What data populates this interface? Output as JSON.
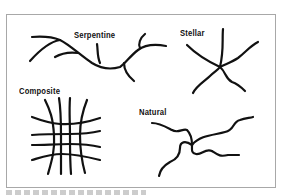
{
  "figure": {
    "panels": [
      {
        "id": "serpentine",
        "label": "Serpentine"
      },
      {
        "id": "stellar",
        "label": "Stellar"
      },
      {
        "id": "composite",
        "label": "Composite"
      },
      {
        "id": "natural",
        "label": "Natural"
      }
    ],
    "stroke_color": "#111111",
    "border_color": "#a8a8a8",
    "background": "#ffffff"
  }
}
